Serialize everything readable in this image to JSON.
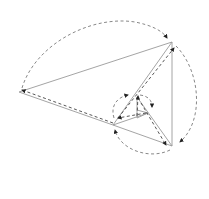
{
  "diagram": {
    "points": {
      "A": [
        19,
        92
      ],
      "B": [
        172,
        42
      ],
      "C": [
        172,
        146
      ],
      "D": [
        113,
        125
      ],
      "E": [
        137,
        97
      ],
      "F": [
        135,
        118
      ],
      "G": [
        148,
        113
      ]
    },
    "colors": {
      "solid_line": "#9a9a9a",
      "dashed_line": "#7a7a7a",
      "arrowhead": "#222222",
      "background": "#ffffff"
    }
  }
}
